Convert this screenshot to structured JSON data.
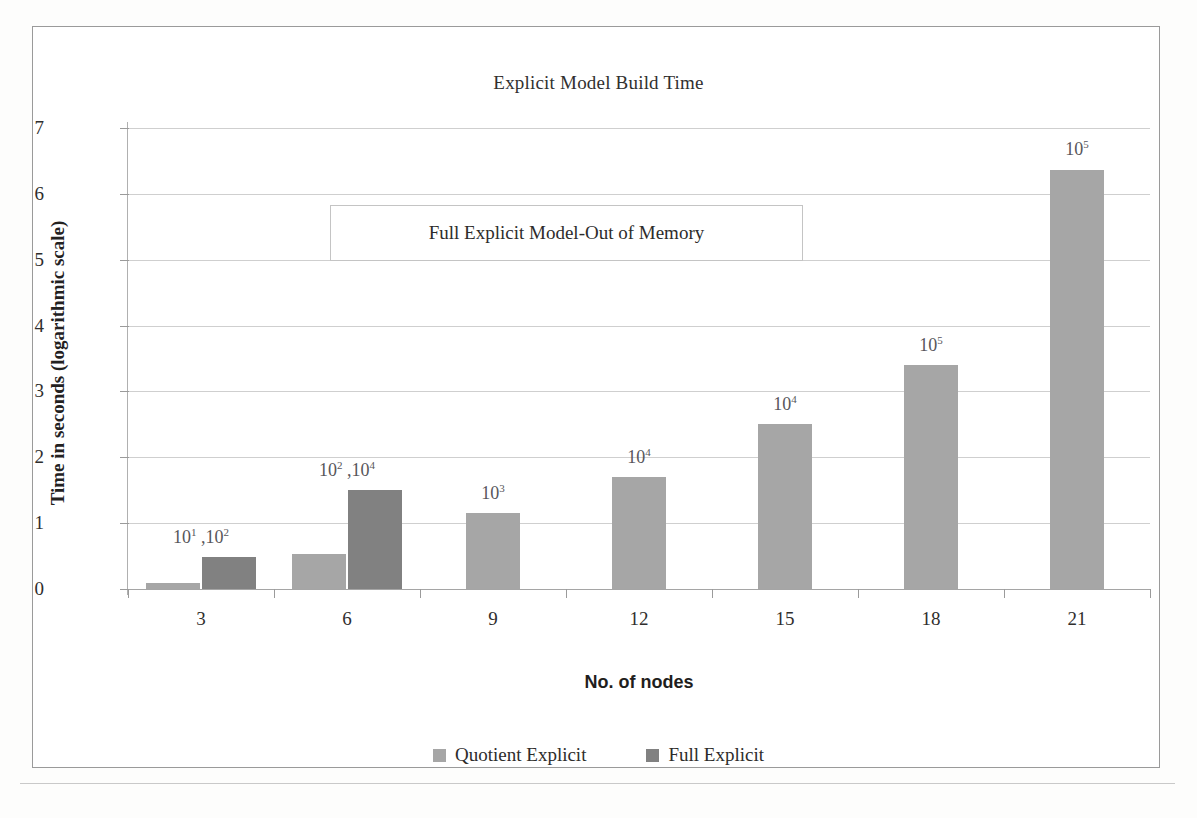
{
  "figure": {
    "title": "Explicit Model Build Time",
    "annotation": "Full Explicit Model-Out of Memory"
  },
  "colors": {
    "quotient": "#a6a6a6",
    "full": "#818181",
    "grid": "#cfcfcf",
    "axis": "#a5a5a5",
    "frame": "#9a9a9a",
    "text": "#2d2c2b",
    "label": "#57565a"
  },
  "chart_data": {
    "type": "bar",
    "title": "Explicit Model Build Time",
    "xlabel": "No. of nodes",
    "ylabel": "Time in seconds (logarithmic scale)",
    "categories": [
      "3",
      "6",
      "9",
      "12",
      "15",
      "18",
      "21"
    ],
    "ylim": [
      0,
      7
    ],
    "yticks": [
      "0",
      "1",
      "2",
      "3",
      "4",
      "5",
      "6",
      "7"
    ],
    "grid": true,
    "legend_position": "bottom",
    "series": [
      {
        "name": "Quotient Explicit",
        "color": "#a6a6a6",
        "values": [
          0.09,
          0.53,
          1.15,
          1.7,
          2.5,
          3.4,
          6.37
        ]
      },
      {
        "name": "Full Explicit",
        "color": "#818181",
        "values": [
          0.48,
          1.5,
          null,
          null,
          null,
          null,
          null
        ]
      }
    ],
    "point_labels": [
      {
        "category": "3",
        "base": "10",
        "exp": "1",
        "base2": "10",
        "exp2": "2",
        "text": "10¹ ,10²"
      },
      {
        "category": "6",
        "base": "10",
        "exp": "2",
        "base2": "10",
        "exp2": "4",
        "text": "10² ,10⁴"
      },
      {
        "category": "9",
        "base": "10",
        "exp": "3",
        "base2": null,
        "exp2": null,
        "text": "10³"
      },
      {
        "category": "12",
        "base": "10",
        "exp": "4",
        "base2": null,
        "exp2": null,
        "text": "10⁴"
      },
      {
        "category": "15",
        "base": "10",
        "exp": "4",
        "base2": null,
        "exp2": null,
        "text": "10⁴"
      },
      {
        "category": "18",
        "base": "10",
        "exp": "5",
        "base2": null,
        "exp2": null,
        "text": "10⁵"
      },
      {
        "category": "21",
        "base": "10",
        "exp": "5",
        "base2": null,
        "exp2": null,
        "text": "10⁵"
      }
    ],
    "annotations": [
      {
        "text": "Full Explicit Model-Out of Memory",
        "boxed": true
      }
    ]
  }
}
